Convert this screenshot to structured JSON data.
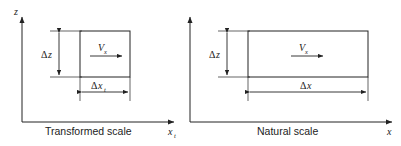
{
  "figure": {
    "panels": [
      {
        "id": "transformed",
        "caption": "Transformed scale",
        "vertical_axis_label": "z",
        "horizontal_axis_label": "x",
        "horizontal_axis_subscript": "t",
        "height_label_delta": "Δ",
        "height_label_var": "z",
        "width_label_delta": "Δ",
        "width_label_var": "x",
        "width_label_subscript": "t",
        "velocity_label": "V",
        "velocity_subscript": "x"
      },
      {
        "id": "natural",
        "caption": "Natural scale",
        "vertical_axis_label": "",
        "horizontal_axis_label": "x",
        "horizontal_axis_subscript": "",
        "height_label_delta": "Δ",
        "height_label_var": "z",
        "width_label_delta": "Δ",
        "width_label_var": "x",
        "width_label_subscript": "",
        "velocity_label": "V",
        "velocity_subscript": "x"
      }
    ],
    "colors": {
      "line": "#222222",
      "background": "#ffffff",
      "text": "#222222"
    }
  }
}
